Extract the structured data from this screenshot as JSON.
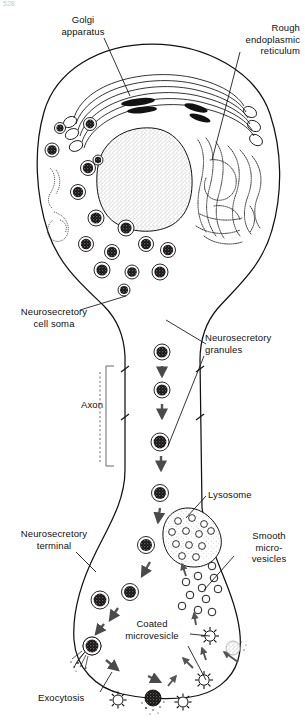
{
  "figure": {
    "page_number": "528",
    "ink_color": "#111111",
    "background_color": "#ffffff"
  },
  "labels": {
    "golgi": "Golgi\napparatus",
    "rough_er": "Rough\nendoplasmic\nreticulum",
    "cell_soma": "Neurosecretory\ncell soma",
    "granules": "Neurosecretory\ngranules",
    "axon": "Axon",
    "lysosome": "Lysosome",
    "terminal": "Neurosecretory\nterminal",
    "smooth_microvesicles": "Smooth\nmicro-\nvesicles",
    "coated_microvesicle": "Coated\nmicrovesicle",
    "exocytosis": "Exocytosis"
  },
  "structures": {
    "nucleus": {
      "name": "nucleus",
      "style": "stippled-oval"
    },
    "golgi_apparatus": {
      "name": "golgi-apparatus",
      "cisternae": 6,
      "condensing_granules": 3
    },
    "rough_er": {
      "name": "rough-endoplasmic-reticulum",
      "style": "stippled-whorled-lamellae"
    },
    "lysosome": {
      "name": "lysosome",
      "inner_vesicles": 12
    },
    "smooth_microvesicles": {
      "name": "smooth-microvesicles",
      "count": 11
    },
    "coated_microvesicles": {
      "name": "coated-microvesicles",
      "count": 4,
      "spikes": 10
    },
    "secretory_granules": {
      "name": "neurosecretory-granules",
      "soma_count": 15,
      "axon_count": 7,
      "terminal_count": 5
    },
    "exocytosis_sites": {
      "name": "exocytosis-sites",
      "count": 4
    }
  }
}
